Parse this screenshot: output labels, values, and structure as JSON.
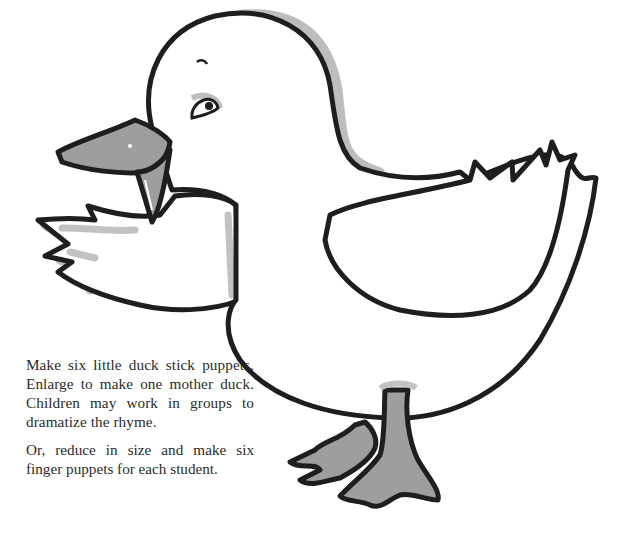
{
  "illustration": {
    "subject": "duck",
    "colors": {
      "outline": "#1e1e1e",
      "shadow": "#b9b9b9",
      "beak_feet": "#9a9a9a",
      "fill": "#ffffff"
    }
  },
  "instructions": {
    "paragraph1": "Make six little duck stick puppets. Enlarge to make one mother duck. Children may work in groups to dramatize the rhyme.",
    "paragraph2": "Or, reduce in size and make six finger puppets for each student."
  }
}
